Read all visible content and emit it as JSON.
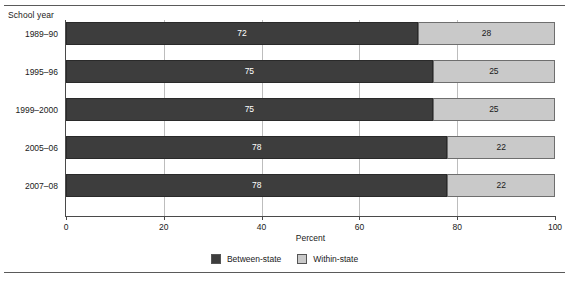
{
  "chart_data": {
    "type": "bar",
    "orientation": "horizontal",
    "stacked": true,
    "normalized_percent": true,
    "title": "",
    "category_axis_title": "School year",
    "xlabel": "Percent",
    "ylabel": "",
    "xlim": [
      0,
      100
    ],
    "xticks": [
      0,
      20,
      40,
      60,
      80,
      100
    ],
    "xtick_labels": [
      "0",
      "20",
      "40",
      "60",
      "80",
      "100"
    ],
    "grid": "vertical-gridlines-between-bars",
    "legend_position": "bottom-center",
    "categories": [
      "1989–90",
      "1995–96",
      "1999–2000",
      "2005–06",
      "2007–08"
    ],
    "series": [
      {
        "name": "Between-state",
        "color": "#3d3d3d",
        "values": [
          72,
          75,
          75,
          78,
          78
        ],
        "labels": [
          "72",
          "75",
          "75",
          "78",
          "78"
        ]
      },
      {
        "name": "Within-state",
        "color": "#c9c9c9",
        "values": [
          28,
          25,
          25,
          22,
          22
        ],
        "labels": [
          "28",
          "25",
          "25",
          "22",
          "22"
        ]
      }
    ]
  },
  "legend": {
    "items": [
      {
        "label": "Between-state",
        "color": "#3d3d3d"
      },
      {
        "label": "Within-state",
        "color": "#c9c9c9"
      }
    ]
  }
}
